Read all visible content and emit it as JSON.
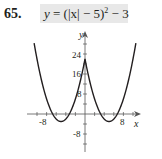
{
  "problem": {
    "number": "65.",
    "equation": {
      "lhs": "y",
      "rhs_before": " = (|x| − 5)",
      "exponent": "2",
      "rhs_after": " − 3"
    },
    "highlight_color": "#e8e8e8"
  },
  "chart_data": {
    "type": "line",
    "xlabel": "x",
    "ylabel": "y",
    "x_tick_labels": [
      "-8",
      "8"
    ],
    "y_tick_labels": [
      "24",
      "16",
      "8",
      "-8"
    ],
    "xlim": [
      -11,
      11
    ],
    "ylim": [
      -14,
      32
    ],
    "x_tick_step": 2,
    "y_tick_step": 4,
    "grid": false,
    "series": [
      {
        "name": "y = (|x| − 5)^2 − 3",
        "x": [
          -10.5,
          -10,
          -9,
          -8,
          -7,
          -6,
          -5,
          -4,
          -3,
          -2,
          -1,
          0,
          1,
          2,
          3,
          4,
          5,
          6,
          7,
          8,
          9,
          10,
          10.5
        ],
        "y": [
          27.25,
          22,
          13,
          6,
          1,
          -2,
          -3,
          -2,
          1,
          6,
          13,
          22,
          13,
          6,
          1,
          -2,
          -3,
          -2,
          1,
          6,
          13,
          22,
          27.25
        ]
      }
    ],
    "key_points": {
      "local_max": [
        0,
        22
      ],
      "minima": [
        [
          -5,
          -3
        ],
        [
          5,
          -3
        ]
      ]
    },
    "line_color": "#231f20"
  }
}
